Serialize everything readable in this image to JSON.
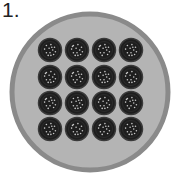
{
  "figure": {
    "label": "1.",
    "outer_circle": {
      "cx": 90,
      "cy": 92,
      "r": 78,
      "ring_color": "#8a8a8a",
      "fill_color": "#b4b4b4",
      "ring_width": 5
    },
    "grid": {
      "rows": 4,
      "cols": 4,
      "cx": [
        50,
        77,
        104,
        131
      ],
      "cy": [
        50,
        77,
        103,
        129
      ],
      "r": 11.5,
      "fill_color": "#1e1e1e",
      "rim_color": "#3a3a3a",
      "dot_color": "#c8c8c8"
    }
  }
}
